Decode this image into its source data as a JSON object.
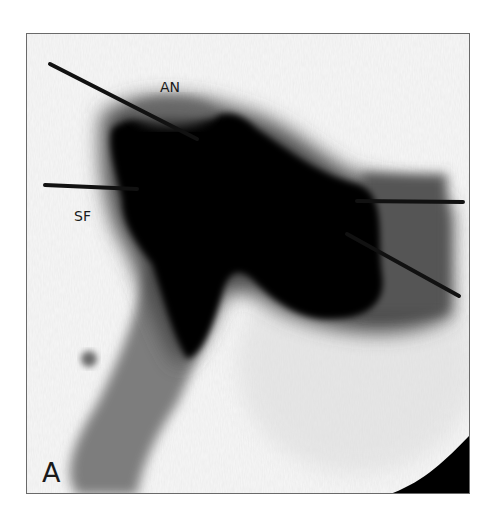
{
  "figure": {
    "panel_label": "A",
    "annotations": [
      {
        "id": "an",
        "text": "AN"
      },
      {
        "id": "sf",
        "text": "SF"
      }
    ]
  },
  "colors": {
    "background": "#ffffff",
    "film": "#f7f7f7",
    "contrast": "#050505",
    "soft_tissue": "#7a7a7a",
    "border": "#6a6a6a"
  }
}
